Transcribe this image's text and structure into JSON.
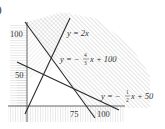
{
  "figure": {
    "part_marker": ")",
    "y_ticks": [
      {
        "label": "100",
        "value": 100
      },
      {
        "label": "50",
        "value": 50
      }
    ],
    "x_ticks": [
      {
        "label": "75",
        "value": 75
      },
      {
        "label": "100",
        "value": 100
      }
    ],
    "lines": [
      {
        "id": "line1",
        "label": "y = 2x",
        "slope": 2,
        "intercept": 0
      },
      {
        "id": "line2",
        "label": "y = −4/3 x + 100",
        "label_prefix": "y = −",
        "frac_num": "4",
        "frac_den": "3",
        "label_suffix": "x + 100",
        "slope": -1.3333,
        "intercept": 100
      },
      {
        "id": "line3",
        "label": "y = −1/2 x + 50",
        "label_prefix": "y = −",
        "frac_num": "1",
        "frac_den": "2",
        "label_suffix": "x + 50",
        "slope": -0.5,
        "intercept": 50
      }
    ],
    "colors": {
      "line": "#2a2a2a",
      "hatch": "#b8b8b8",
      "text": "#333333"
    }
  }
}
